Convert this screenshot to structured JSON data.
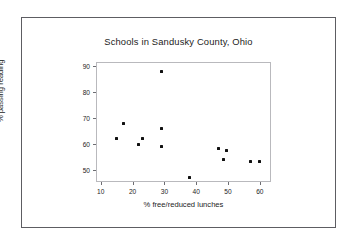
{
  "figure": {
    "background_color": "#ffffff",
    "border_color": "#5d5d62",
    "plot_border_color": "#b9b9bd",
    "point_color": "#111111"
  },
  "chart_data": {
    "type": "scatter",
    "title": "Schools in Sandusky County, Ohio",
    "xlabel": "% free/reduced lunches",
    "ylabel": "% passing reading",
    "xlim": [
      8.5,
      63.5
    ],
    "ylim": [
      45.5,
      91.5
    ],
    "xticks": [
      10,
      20,
      30,
      40,
      50,
      60
    ],
    "yticks": [
      50,
      60,
      70,
      80,
      90
    ],
    "grid": false,
    "legend": null,
    "series": [
      {
        "name": "Schools",
        "x": [
          15.0,
          17.0,
          22.0,
          23.0,
          29.0,
          29.0,
          29.0,
          38.0,
          47.0,
          48.5,
          49.6,
          57.0,
          60.0
        ],
        "y": [
          62.0,
          68.0,
          60.0,
          62.0,
          88.0,
          66.0,
          59.2,
          47.2,
          58.4,
          54.3,
          57.5,
          53.4,
          53.4
        ]
      }
    ]
  }
}
